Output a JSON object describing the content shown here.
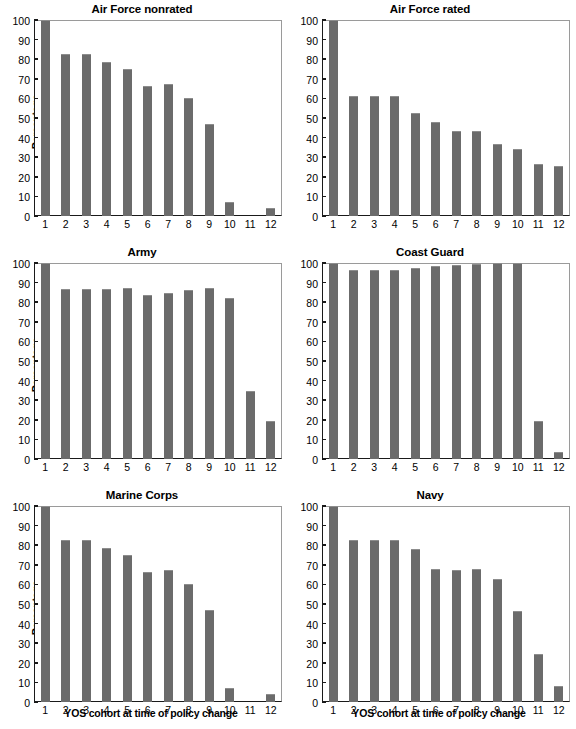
{
  "figure": {
    "shared_xlabel": "YOS cohort at time of policy change",
    "shared_ylabel": "Percentage",
    "bar_color": "#6b6b6b",
    "axis_color": "#1a1a1a",
    "frame_color": "#9a9a9a",
    "background": "#ffffff"
  },
  "axis": {
    "yticks": [
      "0",
      "10",
      "20",
      "30",
      "40",
      "50",
      "60",
      "70",
      "80",
      "90",
      "100"
    ],
    "xticks": [
      "1",
      "2",
      "3",
      "4",
      "5",
      "6",
      "7",
      "8",
      "9",
      "10",
      "11",
      "12"
    ]
  },
  "chart_data": [
    {
      "type": "bar",
      "title": "Air Force nonrated",
      "xlabel": "",
      "ylabel": "Percentage",
      "categories": [
        "1",
        "2",
        "3",
        "4",
        "5",
        "6",
        "7",
        "8",
        "9",
        "10",
        "11",
        "12"
      ],
      "values": [
        100,
        82.5,
        82.5,
        78.5,
        75,
        66.5,
        67.5,
        60,
        47,
        7,
        0,
        4
      ],
      "ylim": [
        0,
        100
      ],
      "grid": false,
      "legend": false
    },
    {
      "type": "bar",
      "title": "Air Force rated",
      "xlabel": "",
      "ylabel": "",
      "categories": [
        "1",
        "2",
        "3",
        "4",
        "5",
        "6",
        "7",
        "8",
        "9",
        "10",
        "11",
        "12"
      ],
      "values": [
        100,
        61,
        61,
        61,
        52.5,
        48,
        43.5,
        43.5,
        36.5,
        34,
        26.5,
        25.5
      ],
      "ylim": [
        0,
        100
      ],
      "grid": false,
      "legend": false
    },
    {
      "type": "bar",
      "title": "Army",
      "xlabel": "",
      "ylabel": "Percentage",
      "categories": [
        "1",
        "2",
        "3",
        "4",
        "5",
        "6",
        "7",
        "8",
        "9",
        "10",
        "11",
        "12"
      ],
      "values": [
        100,
        86.5,
        86.5,
        86.5,
        87.5,
        83.5,
        84.5,
        86,
        87.5,
        82,
        34.5,
        19.5
      ],
      "ylim": [
        0,
        100
      ],
      "grid": false,
      "legend": false
    },
    {
      "type": "bar",
      "title": "Coast Guard",
      "xlabel": "",
      "ylabel": "",
      "categories": [
        "1",
        "2",
        "3",
        "4",
        "5",
        "6",
        "7",
        "8",
        "9",
        "10",
        "11",
        "12"
      ],
      "values": [
        100,
        96.5,
        96.5,
        96.5,
        97.5,
        98.5,
        99,
        99.5,
        100,
        100,
        19.5,
        3.5
      ],
      "ylim": [
        0,
        100
      ],
      "grid": false,
      "legend": false
    },
    {
      "type": "bar",
      "title": "Marine Corps",
      "xlabel": "YOS cohort at time of policy change",
      "ylabel": "Percentage",
      "categories": [
        "1",
        "2",
        "3",
        "4",
        "5",
        "6",
        "7",
        "8",
        "9",
        "10",
        "11",
        "12"
      ],
      "values": [
        100,
        82.5,
        82.5,
        78.5,
        75,
        66.5,
        67.5,
        60,
        47,
        7,
        0,
        4
      ],
      "ylim": [
        0,
        100
      ],
      "grid": false,
      "legend": false
    },
    {
      "type": "bar",
      "title": "Navy",
      "xlabel": "YOS cohort at time of policy change",
      "ylabel": "",
      "categories": [
        "1",
        "2",
        "3",
        "4",
        "5",
        "6",
        "7",
        "8",
        "9",
        "10",
        "11",
        "12"
      ],
      "values": [
        100,
        82.5,
        82.5,
        82.5,
        78,
        68,
        67.5,
        68,
        63,
        46.5,
        24.5,
        8
      ],
      "ylim": [
        0,
        100
      ],
      "grid": false,
      "legend": false
    }
  ]
}
